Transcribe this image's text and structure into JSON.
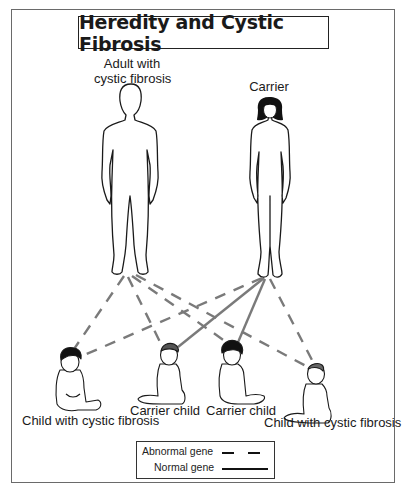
{
  "title": "Heredity and Cystic Fibrosis",
  "parents": [
    {
      "label_line1": "Adult with",
      "label_line2": "cystic fibrosis",
      "role": "affected-adult"
    },
    {
      "label": "Carrier",
      "role": "carrier-adult"
    }
  ],
  "children": [
    {
      "label": "Child with cystic fibrosis",
      "genes_from_father": "abnormal",
      "genes_from_mother": "abnormal"
    },
    {
      "label": "Carrier child",
      "genes_from_father": "abnormal",
      "genes_from_mother": "normal"
    },
    {
      "label": "Carrier child",
      "genes_from_father": "abnormal",
      "genes_from_mother": "normal"
    },
    {
      "label": "Child with cystic fibrosis",
      "genes_from_father": "abnormal",
      "genes_from_mother": "abnormal"
    }
  ],
  "legend": {
    "abnormal_label": "Abnormal gene",
    "abnormal_style": "dashed",
    "normal_label": "Normal gene",
    "normal_style": "solid"
  },
  "colors": {
    "line": "#7a7a7a",
    "outline": "#1a1a1a",
    "frame": "#6a6a6a"
  }
}
